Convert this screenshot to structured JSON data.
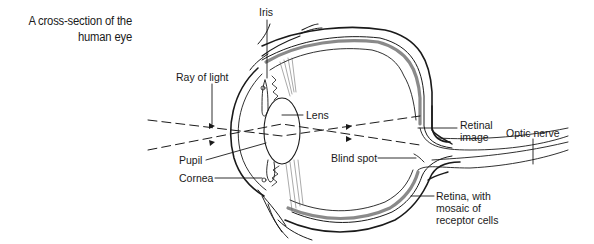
{
  "title": {
    "line1": "A cross-section of the",
    "line2": "human eye"
  },
  "labels": {
    "iris": "Iris",
    "ray_of_light": "Ray of light",
    "lens": "Lens",
    "pupil": "Pupil",
    "cornea": "Cornea",
    "blind_spot": "Blind spot",
    "retinal_image_1": "Retinal",
    "retinal_image_2": "image",
    "optic_nerve": "Optic nerve",
    "retina_1": "Retina, with",
    "retina_2": "mosaic of",
    "retina_3": "receptor cells"
  },
  "colors": {
    "line": "#1a1a1a",
    "retina_fill": "#8a8a8a",
    "background": "#ffffff"
  }
}
